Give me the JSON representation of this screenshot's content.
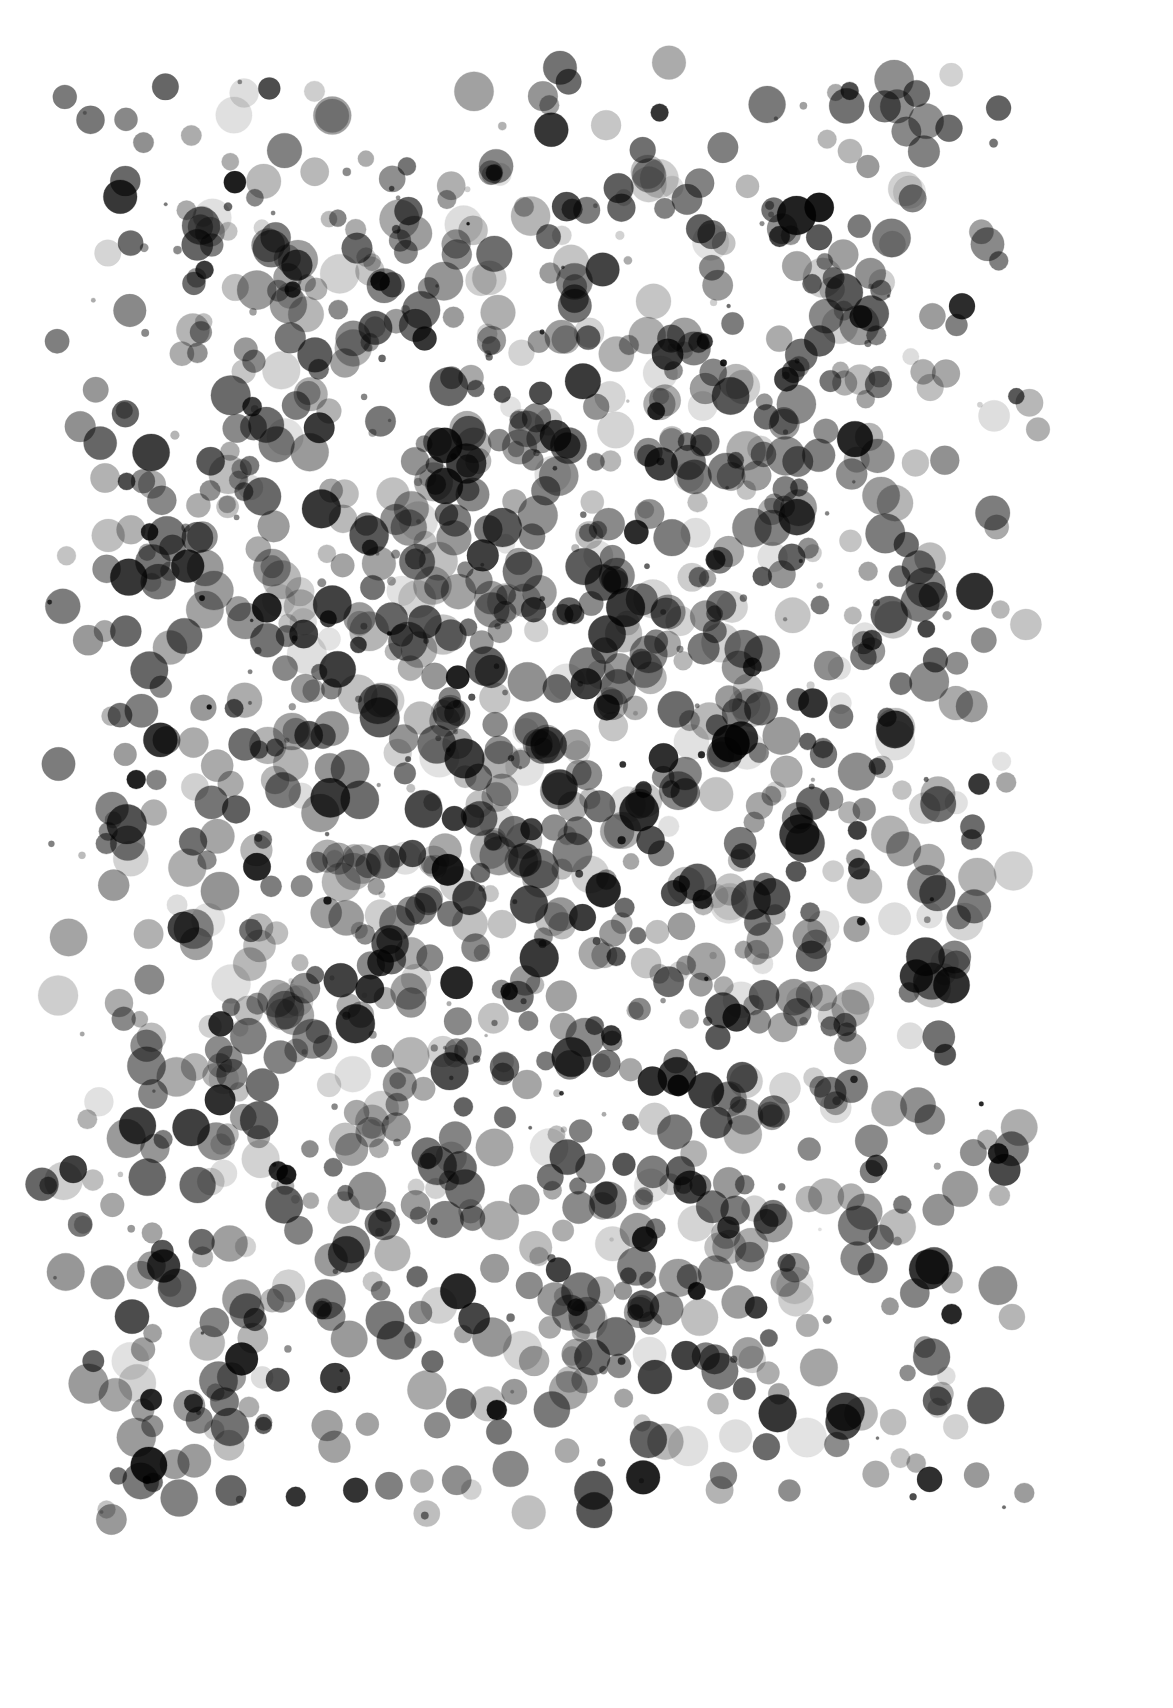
{
  "artwork": {
    "title": "",
    "background": "#ffffff",
    "width": 1173,
    "height": 1708,
    "field": {
      "x0": 60,
      "y0": 80,
      "x1": 1020,
      "y1": 1500
    },
    "center": {
      "x": 540,
      "y": 790
    },
    "dot_count": 1650,
    "seed": 20240607,
    "radius_range": [
      4,
      20
    ],
    "small_dot_fraction": 0.12,
    "palette_grays": [
      "#1a1a1a",
      "#333333",
      "#555555",
      "#666666",
      "#777777",
      "#888888",
      "#999999",
      "#aaaaaa",
      "#bbbbbb",
      "#cccccc",
      "#dddddd"
    ],
    "palette_weights": [
      0.05,
      0.05,
      0.08,
      0.12,
      0.14,
      0.14,
      0.13,
      0.11,
      0.08,
      0.06,
      0.04
    ],
    "edge_ring_opacity": 0.25,
    "description": "Grayscale watercolor dots scattered densely in the center and thinning toward edges"
  }
}
